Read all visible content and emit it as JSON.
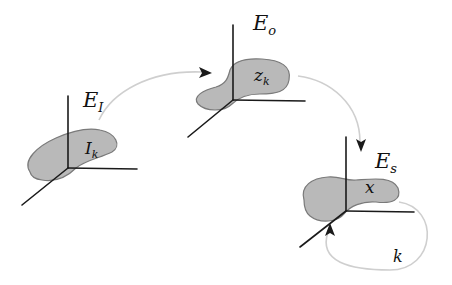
{
  "diagram": {
    "colors": {
      "background": "#ffffff",
      "axes": "#1a1a1a",
      "region_fill": "#b9b9b9",
      "region_stroke": "#7a7a7a",
      "arrow_line": "#cfcfcf",
      "arrow_head": "#1a1a1a"
    },
    "nodes": [
      {
        "id": "input",
        "space_label": "E",
        "space_sub": "I",
        "region_label": "I",
        "region_sub": "k"
      },
      {
        "id": "latent",
        "space_label": "E",
        "space_sub": "o",
        "region_label": "z",
        "region_sub": "k"
      },
      {
        "id": "state",
        "space_label": "E",
        "space_sub": "s",
        "region_label": "x",
        "region_sub": ""
      }
    ],
    "edges": [
      {
        "from": "input",
        "to": "latent",
        "label": ""
      },
      {
        "from": "latent",
        "to": "state",
        "label": ""
      },
      {
        "from": "state",
        "to": "state",
        "label": "k"
      }
    ]
  }
}
